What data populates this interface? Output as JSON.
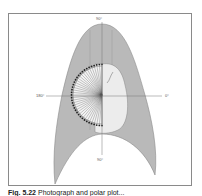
{
  "figure": {
    "axis_labels": {
      "top": "90°",
      "left": "180°",
      "right": "0°",
      "bottom": "90°"
    },
    "caption": {
      "number": "Fig. 5.22",
      "text": "Photograph and polar plot..."
    },
    "colors": {
      "body_fill": "#b9b9b9",
      "organ_fill": "#ececec",
      "frame": "#8a8a8a",
      "axis": "#777777",
      "dots": "#222222"
    },
    "polar_plot": {
      "center": [
        102,
        95
      ],
      "radius": 29,
      "rays": 36,
      "dot_count": 36
    }
  }
}
